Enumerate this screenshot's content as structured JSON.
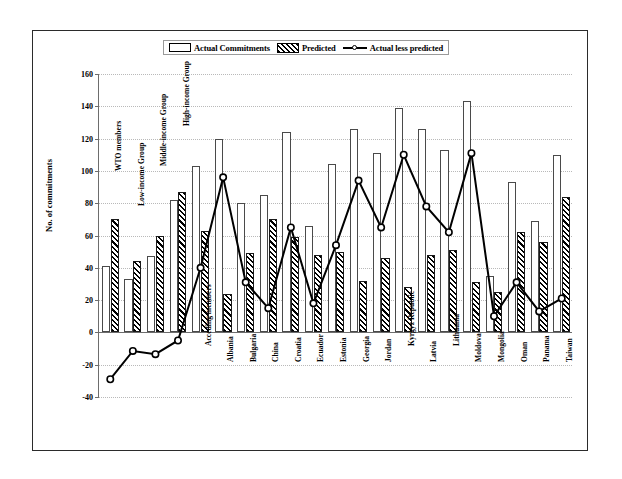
{
  "legend": {
    "items": [
      {
        "label": "Actual Commitments",
        "swatch": "open-bar-icon"
      },
      {
        "label": "Predicted",
        "swatch": "hatched-bar-icon"
      },
      {
        "label": "Actual less predicted",
        "swatch": "line-marker-icon"
      }
    ]
  },
  "axes": {
    "y_title": "No. of commitments",
    "y_ticks": [
      160,
      140,
      120,
      100,
      80,
      60,
      40,
      20,
      0,
      -20,
      -40
    ]
  },
  "chart_data": {
    "type": "bar",
    "title": "",
    "xlabel": "",
    "ylabel": "No. of commitments",
    "ylim": [
      -40,
      160
    ],
    "grid": true,
    "legend_position": "top",
    "categories": [
      "WTO members",
      "Low-income Group",
      "Middle-income Group",
      "High-income Group",
      "Acceding members",
      "Albania",
      "Bulgaria",
      "China",
      "Croatia",
      "Ecuador",
      "Estonia",
      "Georgia",
      "Jordan",
      "Kyrgyz Republic",
      "Latvia",
      "Lithuania",
      "Moldova",
      "Mongolia",
      "Oman",
      "Panama",
      "Taiwan"
    ],
    "series": [
      {
        "name": "Actual Commitments",
        "type": "bar",
        "values": [
          41,
          33,
          47,
          82,
          103,
          120,
          80,
          85,
          124,
          66,
          104,
          126,
          111,
          139,
          126,
          113,
          143,
          35,
          93,
          69,
          110
        ]
      },
      {
        "name": "Predicted",
        "type": "bar",
        "values": [
          70,
          44,
          60,
          87,
          63,
          24,
          49,
          70,
          59,
          48,
          50,
          32,
          46,
          28,
          48,
          51,
          31,
          25,
          62,
          56,
          84
        ]
      },
      {
        "name": "Actual less predicted",
        "type": "line",
        "values": [
          -29,
          -11.5,
          -13.5,
          -5,
          40,
          96,
          31,
          15,
          65,
          18,
          54,
          94,
          65,
          110,
          78,
          62,
          111,
          10,
          31,
          13,
          21
        ]
      }
    ]
  }
}
